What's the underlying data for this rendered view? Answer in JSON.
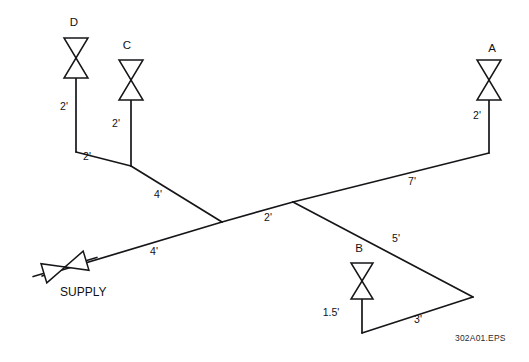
{
  "figure": {
    "file_label": "302A01.EPS",
    "background_color": "#ffffff",
    "line_color": "#16161a",
    "text_color": "#111114"
  },
  "supply": {
    "label": "SUPPLY",
    "valve_name": "supply-valve"
  },
  "valves": [
    {
      "id": "D",
      "label": "D",
      "x": 74,
      "y": 26
    },
    {
      "id": "C",
      "label": "C",
      "x": 127,
      "y": 49
    },
    {
      "id": "A",
      "label": "A",
      "x": 492,
      "y": 52
    },
    {
      "id": "B",
      "label": "B",
      "x": 359,
      "y": 252
    }
  ],
  "dimensions": [
    {
      "id": "d-drop",
      "label": "2'",
      "x": 64,
      "y": 110,
      "for": "valve-D-riser"
    },
    {
      "id": "c-drop",
      "label": "2'",
      "x": 116,
      "y": 127,
      "for": "valve-C-riser"
    },
    {
      "id": "d-to-c-run",
      "label": "2'",
      "x": 87,
      "y": 160,
      "for": "D-to-C-branch"
    },
    {
      "id": "c-to-main",
      "label": "4'",
      "x": 158,
      "y": 198,
      "for": "C-to-main-run"
    },
    {
      "id": "supply-run",
      "label": "4'",
      "x": 154,
      "y": 255,
      "for": "supply-to-main-run"
    },
    {
      "id": "main-mid",
      "label": "2'",
      "x": 268,
      "y": 221,
      "for": "main-cross-run"
    },
    {
      "id": "main-to-a",
      "label": "7'",
      "x": 412,
      "y": 185,
      "for": "main-to-A-run"
    },
    {
      "id": "a-riser",
      "label": "2'",
      "x": 477,
      "y": 119,
      "for": "valve-A-riser"
    },
    {
      "id": "branch-to-b",
      "label": "5'",
      "x": 396,
      "y": 242,
      "for": "branch-to-apex-run"
    },
    {
      "id": "apex-to-b",
      "label": "3'",
      "x": 418,
      "y": 323,
      "for": "apex-to-B-run"
    },
    {
      "id": "b-riser",
      "label": "1.5'",
      "x": 331,
      "y": 316,
      "for": "valve-B-riser"
    }
  ],
  "pipes": [
    {
      "id": "valve-D-riser",
      "points": "76,78 76,152"
    },
    {
      "id": "D-to-C-branch",
      "points": "76,152 131,166"
    },
    {
      "id": "valve-C-riser",
      "points": "131,100 131,166"
    },
    {
      "id": "C-to-main-run",
      "points": "131,166 222,222"
    },
    {
      "id": "supply-to-main-run",
      "points": "42,276 222,222"
    },
    {
      "id": "main-cross-run",
      "points": "222,222 293,202"
    },
    {
      "id": "main-to-A-run",
      "points": "293,202 489,153"
    },
    {
      "id": "valve-A-riser-leg",
      "points": "489,153 489,100"
    },
    {
      "id": "branch-to-apex-run",
      "points": "293,202 473,297"
    },
    {
      "id": "apex-to-B-run",
      "points": "473,297 362,333"
    },
    {
      "id": "valve-B-riser",
      "points": "362,333 362,281"
    }
  ]
}
